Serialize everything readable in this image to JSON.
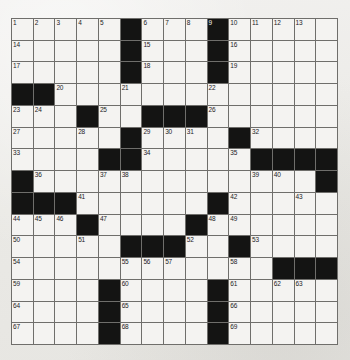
{
  "puzzle": {
    "type": "crossword-grid",
    "title": "Crossword Puzzle Grid",
    "size": {
      "rows": 15,
      "cols": 15
    },
    "colors": {
      "paper": "#edecea",
      "cell_fill": "#f4f3f1",
      "block_fill": "#141413",
      "grid_line": "#6f6e6b",
      "number_text": "#23221f"
    },
    "counts": {
      "total_cells": 225,
      "black_cells": 60,
      "white_cells": 165,
      "highest_number": 69
    },
    "black_cells": [
      [
        0,
        5
      ],
      [
        0,
        9
      ],
      [
        1,
        5
      ],
      [
        1,
        9
      ],
      [
        2,
        5
      ],
      [
        2,
        9
      ],
      [
        3,
        0
      ],
      [
        3,
        1
      ],
      [
        4,
        3
      ],
      [
        4,
        6
      ],
      [
        4,
        7
      ],
      [
        4,
        8
      ],
      [
        5,
        5
      ],
      [
        5,
        10
      ],
      [
        6,
        4
      ],
      [
        6,
        5
      ],
      [
        6,
        11
      ],
      [
        6,
        12
      ],
      [
        6,
        13
      ],
      [
        6,
        14
      ],
      [
        7,
        0
      ],
      [
        7,
        14
      ],
      [
        8,
        0
      ],
      [
        8,
        1
      ],
      [
        8,
        2
      ],
      [
        8,
        9
      ],
      [
        9,
        3
      ],
      [
        9,
        8
      ],
      [
        10,
        5
      ],
      [
        10,
        6
      ],
      [
        10,
        7
      ],
      [
        10,
        10
      ],
      [
        11,
        12
      ],
      [
        11,
        13
      ],
      [
        11,
        14
      ],
      [
        12,
        4
      ],
      [
        12,
        9
      ],
      [
        13,
        4
      ],
      [
        13,
        9
      ],
      [
        14,
        4
      ],
      [
        14,
        9
      ]
    ],
    "numbered_cells": [
      {
        "n": 1,
        "row": 0,
        "col": 0
      },
      {
        "n": 2,
        "row": 0,
        "col": 1
      },
      {
        "n": 3,
        "row": 0,
        "col": 2
      },
      {
        "n": 4,
        "row": 0,
        "col": 3
      },
      {
        "n": 5,
        "row": 0,
        "col": 4
      },
      {
        "n": 6,
        "row": 0,
        "col": 6
      },
      {
        "n": 7,
        "row": 0,
        "col": 7
      },
      {
        "n": 8,
        "row": 0,
        "col": 8
      },
      {
        "n": 9,
        "row": 0,
        "col": 9
      },
      {
        "n": 10,
        "row": 0,
        "col": 10
      },
      {
        "n": 11,
        "row": 0,
        "col": 11
      },
      {
        "n": 12,
        "row": 0,
        "col": 12
      },
      {
        "n": 13,
        "row": 0,
        "col": 13
      },
      {
        "n": 14,
        "row": 1,
        "col": 0
      },
      {
        "n": 15,
        "row": 1,
        "col": 6
      },
      {
        "n": 16,
        "row": 1,
        "col": 10
      },
      {
        "n": 17,
        "row": 2,
        "col": 0
      },
      {
        "n": 18,
        "row": 2,
        "col": 6
      },
      {
        "n": 19,
        "row": 2,
        "col": 10
      },
      {
        "n": 20,
        "row": 3,
        "col": 2
      },
      {
        "n": 21,
        "row": 3,
        "col": 5
      },
      {
        "n": 22,
        "row": 3,
        "col": 9
      },
      {
        "n": 23,
        "row": 4,
        "col": 0
      },
      {
        "n": 24,
        "row": 4,
        "col": 1
      },
      {
        "n": 25,
        "row": 4,
        "col": 4
      },
      {
        "n": 26,
        "row": 4,
        "col": 9
      },
      {
        "n": 27,
        "row": 5,
        "col": 0
      },
      {
        "n": 28,
        "row": 5,
        "col": 3
      },
      {
        "n": 29,
        "row": 5,
        "col": 6
      },
      {
        "n": 30,
        "row": 5,
        "col": 7
      },
      {
        "n": 31,
        "row": 5,
        "col": 8
      },
      {
        "n": 32,
        "row": 5,
        "col": 11
      },
      {
        "n": 33,
        "row": 6,
        "col": 0
      },
      {
        "n": 34,
        "row": 6,
        "col": 6
      },
      {
        "n": 35,
        "row": 6,
        "col": 10
      },
      {
        "n": 36,
        "row": 7,
        "col": 1
      },
      {
        "n": 37,
        "row": 7,
        "col": 4
      },
      {
        "n": 38,
        "row": 7,
        "col": 5
      },
      {
        "n": 39,
        "row": 7,
        "col": 11
      },
      {
        "n": 40,
        "row": 7,
        "col": 12
      },
      {
        "n": 41,
        "row": 8,
        "col": 3
      },
      {
        "n": 42,
        "row": 8,
        "col": 10
      },
      {
        "n": 43,
        "row": 8,
        "col": 13
      },
      {
        "n": 44,
        "row": 9,
        "col": 0
      },
      {
        "n": 45,
        "row": 9,
        "col": 1
      },
      {
        "n": 46,
        "row": 9,
        "col": 2
      },
      {
        "n": 47,
        "row": 9,
        "col": 4
      },
      {
        "n": 48,
        "row": 9,
        "col": 9
      },
      {
        "n": 49,
        "row": 9,
        "col": 10
      },
      {
        "n": 50,
        "row": 10,
        "col": 0
      },
      {
        "n": 51,
        "row": 10,
        "col": 3
      },
      {
        "n": 52,
        "row": 10,
        "col": 8
      },
      {
        "n": 53,
        "row": 10,
        "col": 11
      },
      {
        "n": 54,
        "row": 11,
        "col": 0
      },
      {
        "n": 55,
        "row": 11,
        "col": 5
      },
      {
        "n": 56,
        "row": 11,
        "col": 6
      },
      {
        "n": 57,
        "row": 11,
        "col": 7
      },
      {
        "n": 58,
        "row": 11,
        "col": 10
      },
      {
        "n": 59,
        "row": 12,
        "col": 0
      },
      {
        "n": 60,
        "row": 12,
        "col": 5
      },
      {
        "n": 61,
        "row": 12,
        "col": 10
      },
      {
        "n": 62,
        "row": 12,
        "col": 12
      },
      {
        "n": 63,
        "row": 12,
        "col": 13
      },
      {
        "n": 64,
        "row": 13,
        "col": 0
      },
      {
        "n": 65,
        "row": 13,
        "col": 5
      },
      {
        "n": 66,
        "row": 13,
        "col": 10
      },
      {
        "n": 67,
        "row": 14,
        "col": 0
      },
      {
        "n": 68,
        "row": 14,
        "col": 5
      },
      {
        "n": 69,
        "row": 14,
        "col": 10
      }
    ]
  }
}
